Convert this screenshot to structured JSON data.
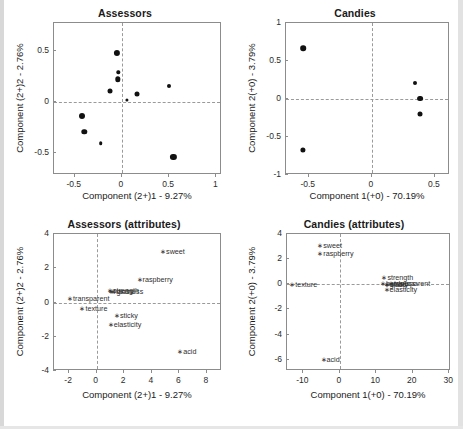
{
  "figure": {
    "background": "#ffffff",
    "marker_color": "#111111",
    "axis_color": "#8c8c8c",
    "dash_color": "#9a9a9a"
  },
  "panels": [
    {
      "key": "assessors_scores",
      "title": "Assessors",
      "xlabel": "Component (2+)1 - 9.27%",
      "ylabel": "Component (2+)2 - 2.76%",
      "xticks": [
        -0.5,
        0,
        0.5,
        1
      ],
      "xticklabels": [
        "-0.5",
        "0",
        "0.5",
        "1"
      ],
      "yticks": [
        0.5,
        0,
        -0.5
      ],
      "yticklabels": [
        "0.5",
        "0",
        "-0.5"
      ],
      "xlim": [
        -0.72,
        1.06
      ],
      "ylim": [
        -0.72,
        0.78
      ]
    },
    {
      "key": "candies_scores",
      "title": "Candies",
      "xlabel": "Component 1(+0) - 70.19%",
      "ylabel": "Component 2(+0) - 3.79%",
      "xticks": [
        -0.5,
        0,
        0.5
      ],
      "xticklabels": [
        "-0.5",
        "0",
        "0.5"
      ],
      "yticks": [
        1,
        0.5,
        0,
        -0.5,
        -1
      ],
      "yticklabels": [
        "1",
        "0.5",
        "0",
        "-0.5",
        "-1"
      ],
      "xlim": [
        -0.68,
        0.62
      ],
      "ylim": [
        -1.0,
        1.0
      ]
    },
    {
      "key": "assessors_attributes",
      "title": "Assessors (attributes)",
      "xlabel": "Component (2+)1 - 9.27%",
      "ylabel": "Component (2+)2 - 2.76%",
      "xticks": [
        -2,
        0,
        2,
        4,
        6,
        8
      ],
      "xticklabels": [
        "-2",
        "0",
        "2",
        "4",
        "6",
        "8"
      ],
      "yticks": [
        4,
        2,
        0,
        -2,
        -4
      ],
      "yticklabels": [
        "4",
        "2",
        "0",
        "-2",
        "-4"
      ],
      "xlim": [
        -3.1,
        9.1
      ],
      "ylim": [
        -4.0,
        4.0
      ]
    },
    {
      "key": "candies_attributes",
      "title": "Candies (attributes)",
      "xlabel": "Component 1(+0) - 70.19%",
      "ylabel": "Component 2(+0) - 3.79%",
      "xticks": [
        -10,
        0,
        10,
        20,
        30
      ],
      "xticklabels": [
        "-10",
        "0",
        "10",
        "20",
        "30"
      ],
      "yticks": [
        4,
        2,
        0,
        -2,
        -4,
        -6
      ],
      "yticklabels": [
        "4",
        "2",
        "0",
        "-2",
        "-4",
        "-6"
      ],
      "xlim": [
        -14.5,
        30.5
      ],
      "ylim": [
        -6.9,
        4.0
      ]
    }
  ],
  "chart_data": [
    {
      "type": "scatter",
      "key": "assessors_scores",
      "title": "Assessors",
      "xlabel": "Component (2+)1 - 9.27%",
      "ylabel": "Component (2+)2 - 2.76%",
      "xlim": [
        -0.72,
        1.06
      ],
      "ylim": [
        -0.72,
        0.78
      ],
      "grid": false,
      "legend": "none",
      "reference_lines": {
        "horizontal": 0,
        "vertical": 0,
        "style": "dashed"
      },
      "points": [
        {
          "x": -0.05,
          "y": 0.485,
          "size": 6.2
        },
        {
          "x": -0.04,
          "y": 0.295,
          "size": 3.4
        },
        {
          "x": -0.045,
          "y": 0.225,
          "size": 5.4
        },
        {
          "x": -0.125,
          "y": 0.105,
          "size": 5.0
        },
        {
          "x": 0.155,
          "y": 0.075,
          "size": 5.0
        },
        {
          "x": 0.055,
          "y": 0.025,
          "size": 3.2
        },
        {
          "x": 0.5,
          "y": 0.16,
          "size": 4.0
        },
        {
          "x": -0.42,
          "y": -0.14,
          "size": 6.0
        },
        {
          "x": -0.4,
          "y": -0.295,
          "size": 5.4
        },
        {
          "x": -0.225,
          "y": -0.405,
          "size": 3.6
        },
        {
          "x": 0.545,
          "y": -0.545,
          "size": 6.2
        }
      ]
    },
    {
      "type": "scatter",
      "key": "candies_scores",
      "title": "Candies",
      "xlabel": "Component 1(+0) - 70.19%",
      "ylabel": "Component 2(+0) - 3.79%",
      "xlim": [
        -0.68,
        0.62
      ],
      "ylim": [
        -1.0,
        1.0
      ],
      "grid": false,
      "legend": "none",
      "reference_lines": {
        "horizontal": 0,
        "vertical": 0,
        "style": "dashed"
      },
      "points": [
        {
          "x": -0.545,
          "y": 0.665,
          "size": 5.6
        },
        {
          "x": -0.545,
          "y": -0.675,
          "size": 5.2
        },
        {
          "x": 0.345,
          "y": 0.205,
          "size": 4.0
        },
        {
          "x": 0.385,
          "y": 0.005,
          "size": 5.8
        },
        {
          "x": 0.385,
          "y": -0.195,
          "size": 5.0
        }
      ]
    },
    {
      "type": "scatter",
      "key": "assessors_attributes",
      "title": "Assessors (attributes)",
      "xlabel": "Component (2+)1 - 9.27%",
      "ylabel": "Component (2+)2 - 2.76%",
      "xlim": [
        -3.1,
        9.1
      ],
      "ylim": [
        -4.0,
        4.0
      ],
      "grid": false,
      "legend": "none",
      "reference_lines": {
        "horizontal": 0,
        "vertical": 0,
        "style": "dashed"
      },
      "labels": [
        {
          "text": "sweet",
          "x": 4.6,
          "y": 3.0
        },
        {
          "text": "raspberry",
          "x": 2.9,
          "y": 1.35
        },
        {
          "text": "strength",
          "x": 0.75,
          "y": 0.72
        },
        {
          "text": "hardness",
          "x": 0.8,
          "y": 0.7
        },
        {
          "text": "gloss",
          "x": 1.0,
          "y": 0.68
        },
        {
          "text": "transparent",
          "x": -2.15,
          "y": 0.25
        },
        {
          "text": "texture",
          "x": -1.25,
          "y": -0.3
        },
        {
          "text": "sticky",
          "x": 1.25,
          "y": -0.72
        },
        {
          "text": "elasticity",
          "x": 0.8,
          "y": -1.25
        },
        {
          "text": "acid",
          "x": 5.85,
          "y": -2.85
        }
      ]
    },
    {
      "type": "scatter",
      "key": "candies_attributes",
      "title": "Candies (attributes)",
      "xlabel": "Component 1(+0) - 70.19%",
      "ylabel": "Component 2(+0) - 3.79%",
      "xlim": [
        -14.5,
        30.5
      ],
      "ylim": [
        -6.9,
        4.0
      ],
      "grid": false,
      "legend": "none",
      "reference_lines": {
        "horizontal": 0,
        "vertical": 0,
        "style": "dashed"
      },
      "labels": [
        {
          "text": "sweet",
          "x": -6.2,
          "y": 3.15
        },
        {
          "text": "raspberry",
          "x": -6.2,
          "y": 2.5
        },
        {
          "text": "strength",
          "x": 11.4,
          "y": 0.55
        },
        {
          "text": "hardness",
          "x": 11.0,
          "y": 0.1
        },
        {
          "text": "gloss",
          "x": 12.0,
          "y": 0.05
        },
        {
          "text": "sticky",
          "x": 12.2,
          "y": 0.0
        },
        {
          "text": "transparent",
          "x": 13.2,
          "y": 0.1
        },
        {
          "text": "elasticity",
          "x": 12.0,
          "y": -0.35
        },
        {
          "text": "texture",
          "x": -13.9,
          "y": 0.0
        },
        {
          "text": "acid",
          "x": -5.3,
          "y": -5.95
        }
      ]
    }
  ]
}
